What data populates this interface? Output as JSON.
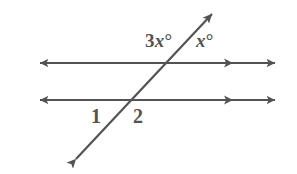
{
  "figure": {
    "type": "geometry-diagram",
    "background_color": "#ffffff",
    "stroke_color": "#535355",
    "stroke_width": 2.2,
    "width": 297,
    "height": 174
  },
  "lines": {
    "upper_parallel": {
      "name": "upper-parallel-line",
      "y": 63,
      "x_start": 33,
      "x_end": 282,
      "left_arrowheads": 1,
      "right_arrowheads": 2,
      "right_arrow_positions": [
        233,
        282
      ]
    },
    "lower_parallel": {
      "name": "lower-parallel-line",
      "y": 100,
      "x_start": 33,
      "x_end": 282,
      "left_arrowheads": 1,
      "right_arrowheads": 2,
      "right_arrow_positions": [
        233,
        282
      ]
    },
    "transversal": {
      "name": "transversal-line",
      "x_start": 70,
      "y_start": 166,
      "x_end": 218,
      "y_end": 8,
      "arrowheads": 2
    }
  },
  "intersections": {
    "upper": {
      "x": 172,
      "y": 63
    },
    "lower": {
      "x": 137,
      "y": 100
    }
  },
  "labels": {
    "angle_3x": {
      "coefficient": "3",
      "variable": "x",
      "degree": "°",
      "full_text": "3x°",
      "position": "above-left-of-upper-intersection"
    },
    "angle_x": {
      "coefficient": "",
      "variable": "x",
      "degree": "°",
      "full_text": "x°",
      "position": "above-right-of-upper-intersection"
    },
    "angle_1": {
      "full_text": "1",
      "position": "below-left-of-lower-intersection"
    },
    "angle_2": {
      "full_text": "2",
      "position": "below-right-of-lower-intersection"
    }
  }
}
